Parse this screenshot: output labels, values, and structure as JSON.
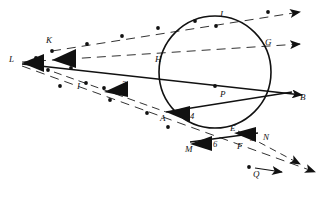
{
  "diagram": {
    "background_color": "#ffffff",
    "stroke_color": "#111111",
    "dash_color": "#333333",
    "circle": {
      "name": "circle-P",
      "center_label": "P",
      "cx": 215,
      "cy": 72,
      "r": 56
    },
    "point_labels": [
      {
        "id": "L",
        "text": "L",
        "x": 9,
        "y": 62
      },
      {
        "id": "K",
        "text": "K",
        "x": 46,
        "y": 43
      },
      {
        "id": "I",
        "text": "I",
        "x": 77,
        "y": 89
      },
      {
        "id": "H",
        "text": "H",
        "x": 155,
        "y": 62
      },
      {
        "id": "J",
        "text": "J",
        "x": 219,
        "y": 17
      },
      {
        "id": "G",
        "text": "G",
        "x": 265,
        "y": 45
      },
      {
        "id": "B",
        "text": "B",
        "x": 300,
        "y": 100
      },
      {
        "id": "A",
        "text": "A",
        "x": 160,
        "y": 121
      },
      {
        "id": "M",
        "text": "M",
        "x": 185,
        "y": 152
      },
      {
        "id": "E",
        "text": "E",
        "x": 230,
        "y": 131
      },
      {
        "id": "F",
        "text": "F",
        "x": 237,
        "y": 149
      },
      {
        "id": "N",
        "text": "N",
        "x": 263,
        "y": 140
      },
      {
        "id": "P",
        "text": "P",
        "x": 220,
        "y": 97
      },
      {
        "id": "Q",
        "text": "Q",
        "x": 253,
        "y": 177
      }
    ],
    "angle_numbers": [
      {
        "id": "angle-1",
        "text": "1",
        "x": 40,
        "y": 66
      },
      {
        "id": "angle-2",
        "text": "2",
        "x": 67,
        "y": 59
      },
      {
        "id": "angle-3",
        "text": "3",
        "x": 122,
        "y": 87
      },
      {
        "id": "angle-4",
        "text": "4",
        "x": 190,
        "y": 119
      },
      {
        "id": "angle-5",
        "text": "5",
        "x": 250,
        "y": 141
      },
      {
        "id": "angle-6",
        "text": "6",
        "x": 213,
        "y": 147
      }
    ],
    "dots": [
      {
        "id": "dot-L-vertex",
        "x": 36,
        "y": 58
      },
      {
        "id": "dot-K",
        "x": 52,
        "y": 51
      },
      {
        "id": "dot-below-K",
        "x": 48,
        "y": 70
      },
      {
        "id": "dot-K2",
        "x": 71,
        "y": 68
      },
      {
        "id": "dot-up-1",
        "x": 87,
        "y": 44
      },
      {
        "id": "dot-up-2",
        "x": 122,
        "y": 36
      },
      {
        "id": "dot-up-3",
        "x": 158,
        "y": 28
      },
      {
        "id": "dot-up-4",
        "x": 195,
        "y": 21
      },
      {
        "id": "dot-up-5",
        "x": 268,
        "y": 12
      },
      {
        "id": "dot-J",
        "x": 216,
        "y": 26
      },
      {
        "id": "dot-I",
        "x": 86,
        "y": 83
      },
      {
        "id": "dot-I2",
        "x": 104,
        "y": 88
      },
      {
        "id": "dot-mid-1",
        "x": 60,
        "y": 86
      },
      {
        "id": "dot-mid-2",
        "x": 110,
        "y": 100
      },
      {
        "id": "dot-mid-3",
        "x": 147,
        "y": 113
      },
      {
        "id": "dot-A-low",
        "x": 168,
        "y": 127
      },
      {
        "id": "dot-P-center",
        "x": 215,
        "y": 86
      },
      {
        "id": "dot-Q",
        "x": 249,
        "y": 167
      }
    ]
  }
}
